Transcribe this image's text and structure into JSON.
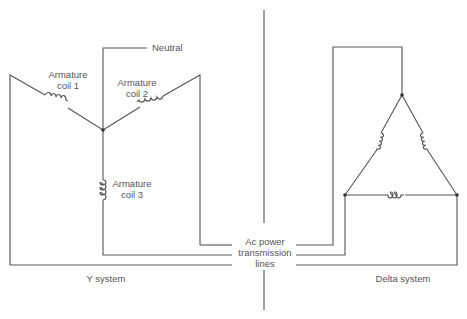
{
  "diagram": {
    "y_system": {
      "caption": "Y system",
      "neutral_label": "Neutral",
      "coils": [
        {
          "line1": "Armature",
          "line2": "coil 1"
        },
        {
          "line1": "Armature",
          "line2": "coil 2"
        },
        {
          "line1": "Armature",
          "line2": "coil 3"
        }
      ]
    },
    "center": {
      "line1": "Ac power",
      "line2": "transmission",
      "line3": "lines"
    },
    "delta_system": {
      "caption": "Delta system"
    },
    "colors": {
      "line": "#555555",
      "text": "#555555",
      "background": "#ffffff"
    }
  }
}
